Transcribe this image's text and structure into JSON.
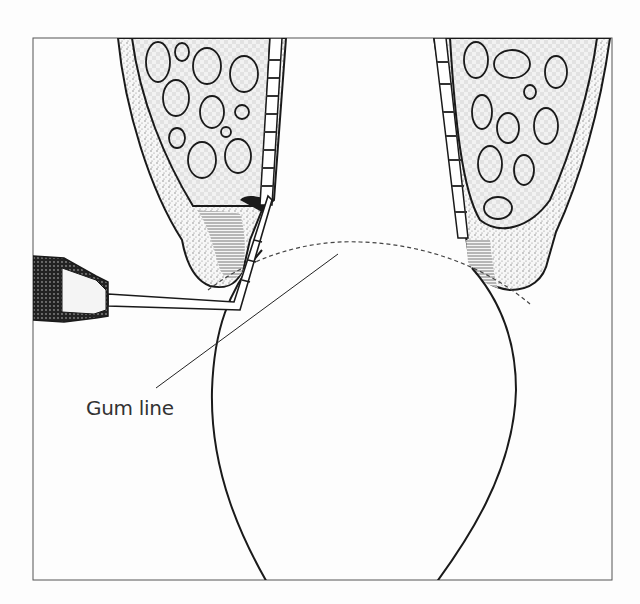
{
  "diagram": {
    "type": "dental cross-section illustration",
    "labels": [
      {
        "text": "Gum line",
        "target": "dashed gum line curve"
      }
    ],
    "elements": [
      "tooth crown",
      "left gum tissue",
      "right gum tissue",
      "bone with marrow spaces",
      "periodontal ligament",
      "periodontal probe",
      "dashed gum line"
    ],
    "colors": {
      "line": "#1a1a1a",
      "background": "#fdfdfd",
      "stipple": "#9a9a9a"
    }
  }
}
